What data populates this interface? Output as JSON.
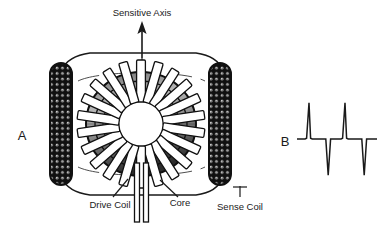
{
  "figure": {
    "title_label": "Sensitive Axis",
    "background_color": "#ffffff",
    "ink_color": "#1a1a1a"
  },
  "panels": [
    {
      "id": "A",
      "letter": "A",
      "description": "ring-core fluxgate sensor cutaway"
    },
    {
      "id": "B",
      "letter": "B",
      "description": "sense coil output waveform"
    }
  ],
  "annotations": {
    "sensitive_axis": "Sensitive Axis",
    "drive_coil": "Drive Coil",
    "core": "Core",
    "sense_coil": "Sense Coil"
  },
  "sensor": {
    "axis_arrow": "up-arrow-icon",
    "centerline": "dashed-vertical-centerline",
    "toroid": {
      "name": "ring-core",
      "cx": 141,
      "cy": 124,
      "outer_rx": 55,
      "outer_ry": 52,
      "inner_rx": 33,
      "inner_ry": 31,
      "winding_bar_count": 22
    },
    "coils": [
      {
        "name": "sense-coil-left",
        "x": 50,
        "y": 63,
        "w": 22,
        "h": 122
      },
      {
        "name": "sense-coil-right",
        "x": 209,
        "y": 63,
        "w": 22,
        "h": 122
      }
    ],
    "leads": {
      "name": "drive-leads",
      "count": 2,
      "x1": 135,
      "x2": 147,
      "top": 165,
      "bottom": 222
    }
  },
  "chart_data": {
    "type": "line",
    "title": "",
    "xlabel": "",
    "ylabel": "",
    "grid": false,
    "legend": false,
    "xlim": [
      0,
      100
    ],
    "ylim": [
      -1.05,
      1.05
    ],
    "series": [
      {
        "name": "Sense Coil Output",
        "x": [
          0,
          10,
          12,
          15,
          17,
          19,
          34,
          36,
          39,
          42,
          44,
          55,
          57,
          60,
          62,
          64,
          79,
          81,
          84,
          87,
          89,
          100
        ],
        "y": [
          0,
          0,
          0.02,
          1.0,
          0.02,
          0,
          0,
          0,
          -1.0,
          0,
          0,
          0,
          0.02,
          1.0,
          0.02,
          0,
          0,
          0,
          -1.0,
          0,
          0,
          0
        ]
      }
    ],
    "annotation": "Bipolar second-harmonic pulse train: positive spike, negative spike, positive spike, negative spike"
  }
}
